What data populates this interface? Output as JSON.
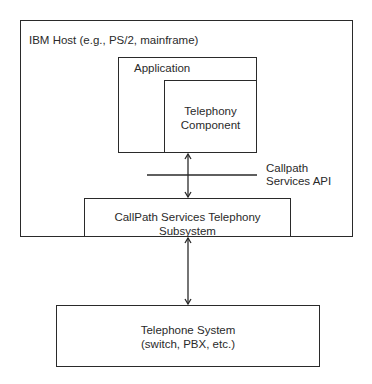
{
  "diagram": {
    "host_box": {
      "label": "IBM Host (e.g., PS/2, mainframe)"
    },
    "application_box": {
      "label": "Application"
    },
    "telephony_component_box": {
      "line1": "Telephony",
      "line2": "Component"
    },
    "api_boundary": {
      "line1": "Callpath",
      "line2": "Services API"
    },
    "subsystem_box": {
      "label": "CallPath Services Telephony Subsystem"
    },
    "telephone_system_box": {
      "line1": "Telephone System",
      "line2": "(switch, PBX, etc.)"
    },
    "connections": [
      {
        "from": "Telephony Component",
        "to": "CallPath Services Telephony Subsystem",
        "type": "bidirectional-arrow"
      },
      {
        "from": "CallPath Services Telephony Subsystem",
        "to": "Telephone System",
        "type": "bidirectional-arrow"
      }
    ],
    "colors": {
      "line": "#2a2a2a",
      "background": "#ffffff"
    }
  }
}
